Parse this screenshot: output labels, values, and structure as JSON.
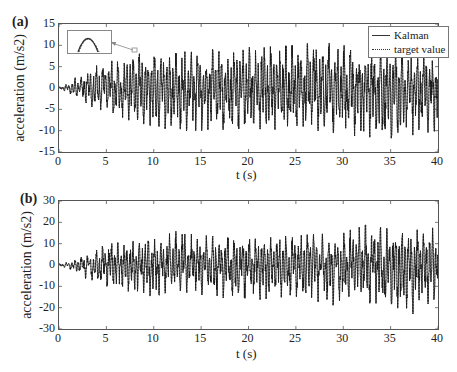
{
  "figure": {
    "panels": [
      {
        "tag": "(a)",
        "ylabel": "acceleration (m/s2)",
        "xlabel": "t (s)"
      },
      {
        "tag": "(b)",
        "ylabel": "acceleration (m/s2)",
        "xlabel": "t (s)"
      }
    ],
    "legend": {
      "items": [
        "Kalman",
        "target value"
      ]
    }
  },
  "chart_data": [
    {
      "type": "line",
      "title": "(a)",
      "xlabel": "t (s)",
      "ylabel": "acceleration (m/s^2)",
      "xlim": [
        0,
        40
      ],
      "ylim": [
        -15,
        15
      ],
      "xticks": [
        0,
        5,
        10,
        15,
        20,
        25,
        30,
        35,
        40
      ],
      "yticks": [
        -15,
        -10,
        -5,
        0,
        5,
        10,
        15
      ],
      "legend": [
        "Kalman",
        "target value"
      ],
      "legend_position": "upper right",
      "annotation": "zoomed inset near t≈8 s showing Kalman and target curves overlapping at a peak",
      "series": [
        {
          "name": "Kalman",
          "style": "solid",
          "envelope_t": [
            0,
            1,
            2,
            3,
            5,
            8,
            12,
            15,
            20,
            25,
            28,
            30,
            35,
            40
          ],
          "envelope_max": [
            0.3,
            1,
            3,
            5,
            6,
            8,
            8.5,
            9,
            9.5,
            10,
            11,
            10,
            9,
            8
          ],
          "envelope_min": [
            -0.3,
            -1,
            -3,
            -4,
            -6,
            -8,
            -10,
            -10,
            -9.5,
            -10,
            -10,
            -11,
            -12,
            -10
          ]
        },
        {
          "name": "target value",
          "style": "dotted",
          "envelope_t": [
            0,
            1,
            2,
            3,
            5,
            8,
            12,
            15,
            20,
            25,
            28,
            30,
            35,
            40
          ],
          "envelope_max": [
            0.3,
            1,
            3,
            5,
            6,
            8,
            8.5,
            9,
            9.5,
            10,
            11,
            10,
            9,
            8
          ],
          "envelope_min": [
            -0.3,
            -1,
            -3,
            -4,
            -6,
            -8,
            -10,
            -10,
            -9.5,
            -10,
            -10,
            -11,
            -12,
            -10
          ]
        }
      ]
    },
    {
      "type": "line",
      "title": "(b)",
      "xlabel": "t (s)",
      "ylabel": "acceleration (m/s^2)",
      "xlim": [
        0,
        40
      ],
      "ylim": [
        -30,
        30
      ],
      "xticks": [
        0,
        5,
        10,
        15,
        20,
        25,
        30,
        35,
        40
      ],
      "yticks": [
        -30,
        -20,
        -10,
        0,
        10,
        20,
        30
      ],
      "series": [
        {
          "name": "Kalman",
          "style": "solid",
          "envelope_t": [
            0,
            1,
            2,
            3,
            5,
            10,
            12,
            15,
            20,
            25,
            30,
            32,
            35,
            37,
            40
          ],
          "envelope_max": [
            0.5,
            1.5,
            3,
            5,
            10,
            12,
            16,
            14,
            12,
            14,
            15,
            19,
            17,
            16,
            18
          ],
          "envelope_min": [
            -0.5,
            -1.5,
            -4,
            -7,
            -10,
            -15,
            -12,
            -14,
            -17,
            -15,
            -20,
            -18,
            -18,
            -24,
            -15
          ]
        },
        {
          "name": "target value",
          "style": "dotted",
          "envelope_t": [
            0,
            1,
            2,
            3,
            5,
            10,
            12,
            15,
            20,
            25,
            30,
            32,
            35,
            37,
            40
          ],
          "envelope_max": [
            0.5,
            1.5,
            3,
            5,
            10,
            12,
            16,
            14,
            12,
            14,
            15,
            19,
            17,
            16,
            18
          ],
          "envelope_min": [
            -0.5,
            -1.5,
            -4,
            -7,
            -10,
            -15,
            -12,
            -14,
            -17,
            -15,
            -20,
            -18,
            -18,
            -24,
            -15
          ]
        }
      ]
    }
  ]
}
